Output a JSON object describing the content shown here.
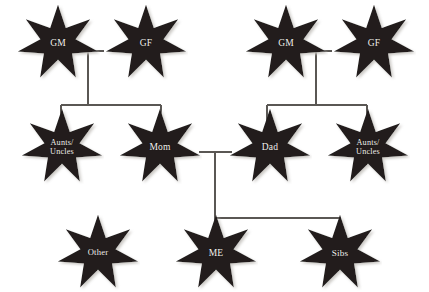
{
  "diagram": {
    "type": "genogram",
    "node_shape": "7-point-star",
    "colors": {
      "node_fill": "#231f1e",
      "node_label": "#f2f0ec",
      "connector": "#5a5754",
      "background": "#ffffff",
      "shadow": "#c9c6c2"
    },
    "nodes": [
      {
        "id": "gm_maternal",
        "label": "GM",
        "generation": 1,
        "x": 16,
        "y": 4,
        "w": 84,
        "h": 78,
        "font_size": 9.5,
        "lines": [
          "GM"
        ]
      },
      {
        "id": "gf_maternal",
        "label": "GF",
        "generation": 1,
        "x": 104,
        "y": 4,
        "w": 84,
        "h": 78,
        "font_size": 9.5,
        "lines": [
          "GF"
        ]
      },
      {
        "id": "gm_paternal",
        "label": "GM",
        "generation": 1,
        "x": 244,
        "y": 4,
        "w": 84,
        "h": 78,
        "font_size": 9.5,
        "lines": [
          "GM"
        ]
      },
      {
        "id": "gf_paternal",
        "label": "GF",
        "generation": 1,
        "x": 332,
        "y": 4,
        "w": 84,
        "h": 78,
        "font_size": 9.5,
        "lines": [
          "GF"
        ]
      },
      {
        "id": "aunts_uncles_maternal",
        "label": "Aunts/ Uncles",
        "generation": 2,
        "x": 20,
        "y": 108,
        "w": 84,
        "h": 78,
        "font_size": 8.2,
        "lines": [
          "Aunts/",
          "Uncles"
        ]
      },
      {
        "id": "mom",
        "label": "Mom",
        "generation": 2,
        "x": 118,
        "y": 108,
        "w": 84,
        "h": 78,
        "font_size": 9.5,
        "lines": [
          "Mom"
        ]
      },
      {
        "id": "dad",
        "label": "Dad",
        "generation": 2,
        "x": 228,
        "y": 108,
        "w": 84,
        "h": 78,
        "font_size": 9.5,
        "lines": [
          "Dad"
        ]
      },
      {
        "id": "aunts_uncles_paternal",
        "label": "Aunts/ Uncles",
        "generation": 2,
        "x": 326,
        "y": 108,
        "w": 84,
        "h": 78,
        "font_size": 8.2,
        "lines": [
          "Aunts/",
          "Uncles"
        ]
      },
      {
        "id": "other",
        "label": "Other",
        "generation": 3,
        "x": 56,
        "y": 214,
        "w": 84,
        "h": 78,
        "font_size": 8.6,
        "lines": [
          "Other"
        ]
      },
      {
        "id": "me",
        "label": "ME",
        "generation": 3,
        "x": 174,
        "y": 214,
        "w": 84,
        "h": 78,
        "font_size": 9.5,
        "lines": [
          "ME"
        ]
      },
      {
        "id": "sibs",
        "label": "Sibs",
        "generation": 3,
        "x": 298,
        "y": 214,
        "w": 84,
        "h": 78,
        "font_size": 9.2,
        "lines": [
          "Sibs"
        ]
      }
    ],
    "connectors": [
      {
        "id": "maternal-couple-bar",
        "from": "gm_maternal",
        "to": "gf_maternal",
        "type": "horizontal",
        "x1": 72,
        "x2": 104,
        "y": 51
      },
      {
        "id": "maternal-drop",
        "type": "vertical",
        "x": 88,
        "y1": 51,
        "y2": 105
      },
      {
        "id": "maternal-children-bar",
        "type": "horizontal",
        "x1": 61,
        "x2": 161,
        "y": 105
      },
      {
        "id": "maternal-child-left",
        "type": "vertical",
        "x": 61,
        "y1": 105,
        "y2": 122
      },
      {
        "id": "maternal-child-right",
        "type": "vertical",
        "x": 161,
        "y1": 105,
        "y2": 122
      },
      {
        "id": "paternal-couple-bar",
        "from": "gm_paternal",
        "to": "gf_paternal",
        "type": "horizontal",
        "x1": 300,
        "x2": 332,
        "y": 51
      },
      {
        "id": "paternal-drop",
        "type": "vertical",
        "x": 316,
        "y1": 51,
        "y2": 105
      },
      {
        "id": "paternal-children-bar",
        "type": "horizontal",
        "x1": 267,
        "x2": 367,
        "y": 105
      },
      {
        "id": "paternal-child-left",
        "type": "vertical",
        "x": 267,
        "y1": 105,
        "y2": 122
      },
      {
        "id": "paternal-child-right",
        "type": "vertical",
        "x": 367,
        "y1": 105,
        "y2": 122
      },
      {
        "id": "parents-couple-bar",
        "from": "mom",
        "to": "dad",
        "type": "horizontal",
        "x1": 199,
        "x2": 232,
        "y": 152
      },
      {
        "id": "parents-drop",
        "type": "vertical",
        "x": 215,
        "y1": 152,
        "y2": 218
      },
      {
        "id": "children-bar",
        "type": "horizontal",
        "x1": 215,
        "x2": 340,
        "y": 218
      },
      {
        "id": "child-me",
        "type": "vertical",
        "x": 215,
        "y1": 218,
        "y2": 228
      },
      {
        "id": "child-sibs",
        "type": "vertical",
        "x": 340,
        "y1": 218,
        "y2": 228
      }
    ]
  }
}
